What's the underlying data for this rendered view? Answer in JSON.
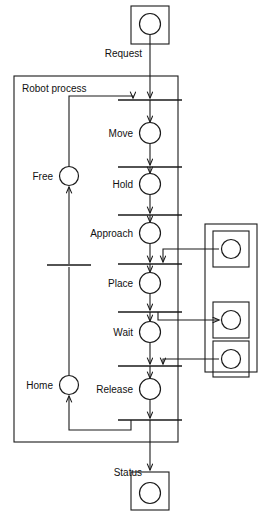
{
  "diagram": {
    "type": "petri-net",
    "colors": {
      "line": "#1a1a1a",
      "background": "#ffffff",
      "text": "#111111"
    },
    "subnet": {
      "label": "Robot process"
    },
    "interface_labels": {
      "request": "Request",
      "status": "Status"
    },
    "places": [
      {
        "id": "request_place",
        "label": "Request",
        "tokens": 0
      },
      {
        "id": "move",
        "label": "Move",
        "tokens": 0
      },
      {
        "id": "hold",
        "label": "Hold",
        "tokens": 0
      },
      {
        "id": "approach",
        "label": "Approach",
        "tokens": 0
      },
      {
        "id": "place",
        "label": "Place",
        "tokens": 0
      },
      {
        "id": "wait",
        "label": "Wait",
        "tokens": 0
      },
      {
        "id": "release",
        "label": "Release",
        "tokens": 0
      },
      {
        "id": "free",
        "label": "Free",
        "tokens": 0
      },
      {
        "id": "home",
        "label": "Home",
        "tokens": 0
      },
      {
        "id": "status_place",
        "label": "Status",
        "tokens": 0
      },
      {
        "id": "resource_1",
        "label": "",
        "tokens": 0
      },
      {
        "id": "resource_2",
        "label": "",
        "tokens": 0
      },
      {
        "id": "resource_3",
        "label": "",
        "tokens": 0
      }
    ],
    "transitions": [
      {
        "id": "t1",
        "label": ""
      },
      {
        "id": "t2",
        "label": ""
      },
      {
        "id": "t3",
        "label": ""
      },
      {
        "id": "t4",
        "label": ""
      },
      {
        "id": "t5",
        "label": ""
      },
      {
        "id": "t6",
        "label": ""
      },
      {
        "id": "t7",
        "label": ""
      },
      {
        "id": "t8",
        "label": ""
      }
    ]
  }
}
